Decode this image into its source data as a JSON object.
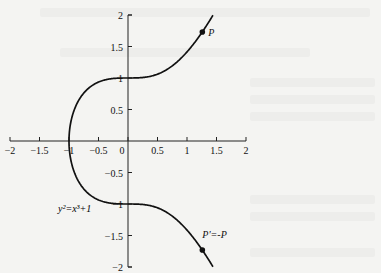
{
  "chart_data": {
    "type": "line",
    "title": "",
    "equation_label": "y²=x³+1",
    "xlabel": "",
    "ylabel": "",
    "xlim": [
      -2,
      2
    ],
    "ylim": [
      -2,
      2
    ],
    "grid": false,
    "x_ticks": [
      -2,
      -1.5,
      -1,
      -0.5,
      0,
      0.5,
      1,
      1.5,
      2
    ],
    "x_tick_labels": [
      "-2",
      "-1.5",
      "-1",
      "-0.5",
      "0",
      "0.5",
      "1",
      "1.5",
      "2"
    ],
    "y_ticks": [
      2,
      1.5,
      1,
      0.5,
      -0.5,
      -1,
      -1.5,
      -2
    ],
    "y_tick_labels": [
      "2",
      "1.5",
      "1",
      "0.5",
      "-0.5",
      "-1",
      "-1.5",
      "-2"
    ],
    "series": [
      {
        "name": "y^2 = x^3 + 1",
        "curve": "elliptic",
        "x_range": [
          -1,
          1.44
        ],
        "color": "#111111"
      }
    ],
    "points": [
      {
        "label": "P",
        "x": 1.26,
        "y": 1.73
      },
      {
        "label": "P'=-P",
        "x": 1.26,
        "y": -1.73
      }
    ]
  },
  "colors": {
    "ink": "#111111",
    "axis": "#222222",
    "background": "#f4f4f2"
  }
}
